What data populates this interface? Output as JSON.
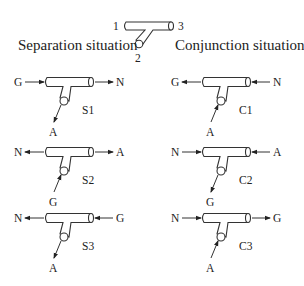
{
  "reference": {
    "port_labels": [
      "1",
      "2",
      "3"
    ],
    "left_title": "Separation situation",
    "right_title": "Conjunction situation"
  },
  "diagrams": [
    {
      "id": "S1",
      "group": "separation",
      "left": "G",
      "right": "N",
      "branch": "A",
      "left_dir": "in",
      "right_dir": "out",
      "branch_dir": "out"
    },
    {
      "id": "S2",
      "group": "separation",
      "left": "N",
      "right": "A",
      "branch": "G",
      "left_dir": "out",
      "right_dir": "out",
      "branch_dir": "in"
    },
    {
      "id": "S3",
      "group": "separation",
      "left": "N",
      "right": "G",
      "branch": "A",
      "left_dir": "out",
      "right_dir": "in",
      "branch_dir": "out"
    },
    {
      "id": "C1",
      "group": "conjunction",
      "left": "G",
      "right": "N",
      "branch": "A",
      "left_dir": "out",
      "right_dir": "in",
      "branch_dir": "in"
    },
    {
      "id": "C2",
      "group": "conjunction",
      "left": "N",
      "right": "A",
      "branch": "G",
      "left_dir": "in",
      "right_dir": "in",
      "branch_dir": "out"
    },
    {
      "id": "C3",
      "group": "conjunction",
      "left": "N",
      "right": "G",
      "branch": "A",
      "left_dir": "in",
      "right_dir": "out",
      "branch_dir": "in"
    }
  ]
}
